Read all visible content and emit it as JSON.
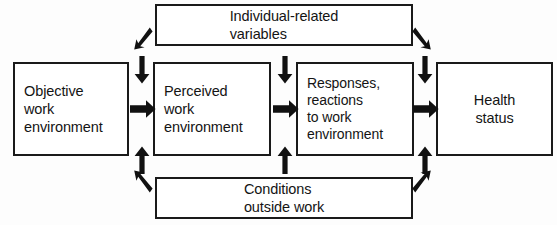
{
  "diagram": {
    "background_color": "#fdfdfd",
    "line_color": "#1a1a1a",
    "text_color": "#141414",
    "nodes": {
      "objective_work_environment": "Objective\nwork\nenvironment",
      "perceived_work_environment": "Perceived\nwork\nenvironment",
      "responses_reactions": "Responses,\nreactions\nto work\nenvironment",
      "health_status": "Health\nstatus",
      "individual_related_variables": "Individual-related\nvariables",
      "conditions_outside_work": "Conditions\noutside  work"
    },
    "arrows": {
      "objective_to_perceived": "arrow-right",
      "perceived_to_responses": "arrow-right",
      "responses_to_health": "arrow-right",
      "individual_down_col1": "arrow-down",
      "individual_down_col2": "arrow-down",
      "individual_down_col3": "arrow-down",
      "conditions_up_col1": "arrow-up",
      "conditions_up_col2": "arrow-up",
      "conditions_up_col3": "arrow-up",
      "individual_diag_left": "arrow-diagonal-down-left",
      "individual_diag_right": "arrow-diagonal-down-right",
      "conditions_diag_left": "arrow-diagonal-up-left",
      "conditions_diag_right": "arrow-diagonal-up-right"
    }
  }
}
